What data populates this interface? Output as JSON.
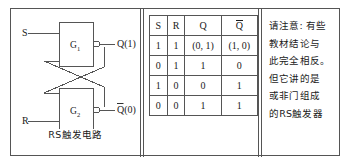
{
  "figure": {
    "circuit": {
      "caption": "RS触发电路",
      "gates": [
        {
          "name": "G1",
          "label": "G",
          "subscript": "1"
        },
        {
          "name": "G2",
          "label": "G",
          "subscript": "2"
        }
      ],
      "inputs": [
        {
          "name": "set-input",
          "label": "S"
        },
        {
          "name": "reset-input",
          "label": "R"
        }
      ],
      "outputs": [
        {
          "name": "q-output",
          "label": "Q(1)"
        },
        {
          "name": "q-bar-output",
          "label": "Q",
          "overline": true,
          "suffix": "(0)"
        }
      ]
    },
    "table": {
      "headers": [
        {
          "text": "S",
          "overline": false
        },
        {
          "text": "R",
          "overline": false
        },
        {
          "text": "Q",
          "overline": false
        },
        {
          "text": "Q",
          "overline": true
        }
      ],
      "rows": [
        [
          "1",
          "1",
          "(0, 1)",
          "(1, 0)"
        ],
        [
          "0",
          "1",
          "1",
          "0"
        ],
        [
          "1",
          "0",
          "0",
          "1"
        ],
        [
          "0",
          "0",
          "1",
          "1"
        ]
      ]
    },
    "note": {
      "lines": [
        "请注意: 有些",
        "教材结论与",
        "此完全相反。",
        "但它讲的是",
        "或非门组成",
        "的RS触发器"
      ]
    }
  }
}
